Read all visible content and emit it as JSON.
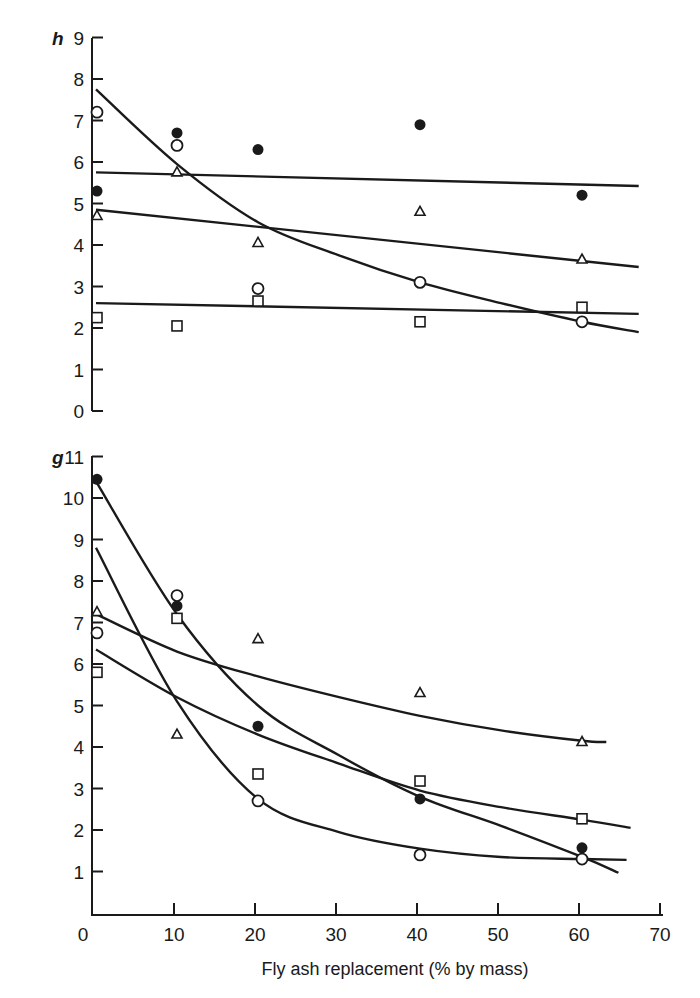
{
  "chart_data": [
    {
      "panel": "h",
      "type": "scatter",
      "title": "",
      "xlabel": "Fly ash replacement (% by mass)",
      "ylabel": "",
      "xlim": [
        0,
        70
      ],
      "ylim": [
        0,
        9
      ],
      "x_ticks": [
        0,
        10,
        20,
        30,
        40,
        50,
        60,
        70
      ],
      "y_ticks": [
        0,
        1,
        2,
        3,
        4,
        5,
        6,
        7,
        8,
        9
      ],
      "grid": false,
      "legend": "none",
      "x": [
        0,
        10,
        20,
        40,
        60
      ],
      "series": [
        {
          "name": "filled circle",
          "marker": "filled-circle",
          "values": [
            5.3,
            6.7,
            6.3,
            6.9,
            5.2
          ],
          "fit": {
            "type": "line",
            "points": [
              [
                0,
                5.75
              ],
              [
                67,
                5.42
              ]
            ]
          }
        },
        {
          "name": "open circle",
          "marker": "open-circle",
          "values": [
            7.2,
            6.4,
            2.95,
            3.1,
            2.15
          ],
          "fit": {
            "type": "exponential-decay",
            "points": [
              [
                0,
                7.75
              ],
              [
                10,
                5.95
              ],
              [
                20,
                4.55
              ],
              [
                30,
                3.75
              ],
              [
                40,
                3.1
              ],
              [
                50,
                2.6
              ],
              [
                60,
                2.15
              ],
              [
                67,
                1.9
              ]
            ]
          }
        },
        {
          "name": "open triangle",
          "marker": "open-triangle",
          "values": [
            4.7,
            5.75,
            4.05,
            4.8,
            3.65
          ],
          "fit": {
            "type": "line",
            "points": [
              [
                0,
                4.85
              ],
              [
                67,
                3.47
              ]
            ]
          }
        },
        {
          "name": "open square",
          "marker": "open-square",
          "values": [
            2.25,
            2.05,
            2.65,
            2.15,
            2.5
          ],
          "fit": {
            "type": "line",
            "points": [
              [
                0,
                2.6
              ],
              [
                67,
                2.34
              ]
            ]
          }
        }
      ]
    },
    {
      "panel": "g",
      "type": "scatter",
      "title": "",
      "xlabel": "Fly ash replacement (% by mass)",
      "ylabel": "",
      "xlim": [
        0,
        70
      ],
      "ylim": [
        0,
        11
      ],
      "x_ticks": [
        0,
        10,
        20,
        30,
        40,
        50,
        60,
        70
      ],
      "y_ticks": [
        1,
        2,
        3,
        4,
        5,
        6,
        7,
        8,
        9,
        10,
        11
      ],
      "grid": false,
      "legend": "none",
      "x": [
        0,
        10,
        20,
        40,
        60
      ],
      "series": [
        {
          "name": "filled circle",
          "marker": "filled-circle",
          "values": [
            10.45,
            7.4,
            4.5,
            2.75,
            1.57
          ],
          "fit": {
            "type": "exponential-decay",
            "points": [
              [
                0,
                10.4
              ],
              [
                10,
                7.2
              ],
              [
                20,
                5.0
              ],
              [
                30,
                3.8
              ],
              [
                40,
                2.8
              ],
              [
                50,
                2.1
              ],
              [
                60,
                1.35
              ],
              [
                64.5,
                0.97
              ]
            ]
          }
        },
        {
          "name": "open circle",
          "marker": "open-circle",
          "values": [
            6.75,
            7.65,
            2.7,
            1.4,
            1.3
          ],
          "fit": {
            "type": "exponential-decay",
            "points": [
              [
                0,
                8.8
              ],
              [
                10,
                5.1
              ],
              [
                20,
                2.75
              ],
              [
                30,
                1.95
              ],
              [
                40,
                1.55
              ],
              [
                50,
                1.35
              ],
              [
                60,
                1.3
              ],
              [
                65.5,
                1.28
              ]
            ]
          }
        },
        {
          "name": "open triangle",
          "marker": "open-triangle",
          "values": [
            7.25,
            4.3,
            6.6,
            5.3,
            4.12
          ],
          "fit": {
            "type": "exponential-decay",
            "points": [
              [
                0,
                7.2
              ],
              [
                10,
                6.3
              ],
              [
                20,
                5.7
              ],
              [
                30,
                5.2
              ],
              [
                40,
                4.75
              ],
              [
                50,
                4.4
              ],
              [
                60,
                4.15
              ],
              [
                63,
                4.12
              ]
            ]
          }
        },
        {
          "name": "open square",
          "marker": "open-square",
          "values": [
            5.8,
            7.1,
            3.35,
            3.18,
            2.27
          ],
          "fit": {
            "type": "exponential-decay",
            "points": [
              [
                0,
                6.35
              ],
              [
                10,
                5.2
              ],
              [
                20,
                4.3
              ],
              [
                30,
                3.6
              ],
              [
                40,
                2.95
              ],
              [
                50,
                2.55
              ],
              [
                60,
                2.25
              ],
              [
                66,
                2.05
              ]
            ]
          }
        }
      ]
    }
  ],
  "labels": {
    "panel_top": "h",
    "panel_bottom": "g",
    "x_axis_title": "Fly ash replacement (% by mass)",
    "x_ticks": [
      "0",
      "10",
      "20",
      "30",
      "40",
      "50",
      "60",
      "70"
    ],
    "top_y_ticks": [
      "9",
      "8",
      "7",
      "6",
      "5",
      "4",
      "3",
      "2",
      "1",
      "0"
    ],
    "bottom_y_ticks": [
      "11",
      "10",
      "9",
      "8",
      "7",
      "6",
      "5",
      "4",
      "3",
      "2",
      "1"
    ]
  },
  "colors": {
    "ink": "#1a1a1a",
    "background": "#ffffff"
  }
}
